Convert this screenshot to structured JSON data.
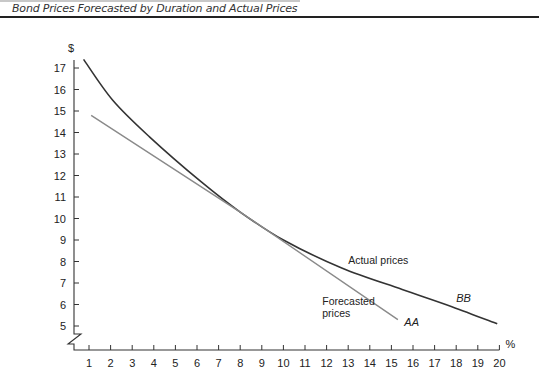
{
  "page": {
    "title": "Bond Prices Forecasted by Duration and Actual Prices"
  },
  "chart_data": {
    "type": "line",
    "title": "Bond Prices Forecasted by Duration and Actual Prices",
    "xlabel": "%",
    "ylabel": "$",
    "xlim": [
      0.5,
      20
    ],
    "ylim": [
      4.5,
      17.5
    ],
    "x_ticks": [
      1,
      2,
      3,
      4,
      5,
      6,
      7,
      8,
      9,
      10,
      11,
      12,
      13,
      14,
      15,
      16,
      17,
      18,
      19,
      20
    ],
    "y_ticks": [
      5,
      6,
      7,
      8,
      9,
      10,
      11,
      12,
      13,
      14,
      15,
      16,
      17
    ],
    "y_axis_break": true,
    "grid": false,
    "series": [
      {
        "name": "Actual prices",
        "label": "BB",
        "color": "#333333",
        "style": "curve",
        "x": [
          0.75,
          2.1,
          3.8,
          6.2,
          8.0,
          10.0,
          12.7,
          15.5,
          17.8,
          19.9
        ],
        "y": [
          17.4,
          15.5,
          13.8,
          11.7,
          10.3,
          9.0,
          7.7,
          6.7,
          5.9,
          5.1
        ]
      },
      {
        "name": "Forecasted prices",
        "label": "AA",
        "color": "#8a8a8a",
        "style": "line",
        "x": [
          1.1,
          8.0,
          15.3
        ],
        "y": [
          14.8,
          10.3,
          5.3
        ]
      }
    ],
    "annotations": [
      {
        "text": "Actual prices",
        "x": 13.0,
        "y": 7.9
      },
      {
        "text": "Forecasted prices",
        "x": 11.8,
        "y": 6.0
      },
      {
        "text": "BB",
        "x": 18.0,
        "y": 6.1
      },
      {
        "text": "AA",
        "x": 15.6,
        "y": 5.0
      }
    ]
  }
}
